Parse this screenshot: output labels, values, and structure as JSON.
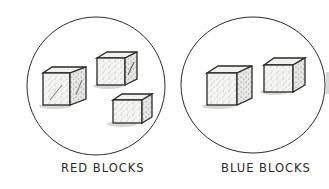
{
  "figure": {
    "groups": [
      {
        "name": "red",
        "label": "RED BLOCKS",
        "block_count": 3
      },
      {
        "name": "blue",
        "label": "BLUE BLOCKS",
        "block_count": 2
      }
    ],
    "colors": {
      "ink": "#2a2a2a",
      "stipple": "#8a8a8a",
      "background": "#ffffff"
    }
  }
}
